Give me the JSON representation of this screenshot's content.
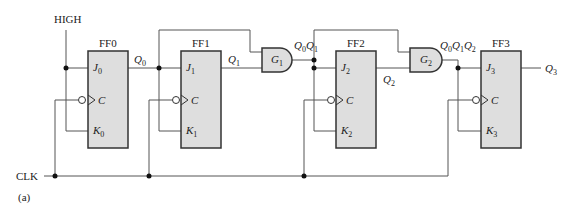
{
  "labels": {
    "high": "HIGH",
    "clk": "CLK",
    "caption": "(a)"
  },
  "flipflops": [
    {
      "name": "FF0",
      "j": "J",
      "k": "K",
      "c": "C",
      "idx": "0",
      "q": "Q",
      "qidx": "0"
    },
    {
      "name": "FF1",
      "j": "J",
      "k": "K",
      "c": "C",
      "idx": "1",
      "q": "Q",
      "qidx": "1"
    },
    {
      "name": "FF2",
      "j": "J",
      "k": "K",
      "c": "C",
      "idx": "2",
      "q": "Q",
      "qidx": "2"
    },
    {
      "name": "FF3",
      "j": "J",
      "k": "K",
      "c": "C",
      "idx": "3",
      "q": "Q",
      "qidx": "3"
    }
  ],
  "gates": [
    {
      "name": "G",
      "idx": "1",
      "output": [
        "0",
        "1"
      ]
    },
    {
      "name": "G",
      "idx": "2",
      "output": [
        "0",
        "1",
        "2"
      ]
    }
  ],
  "colors": {
    "box_fill": "#dedede",
    "stroke": "#333333",
    "wire": "#555555"
  }
}
